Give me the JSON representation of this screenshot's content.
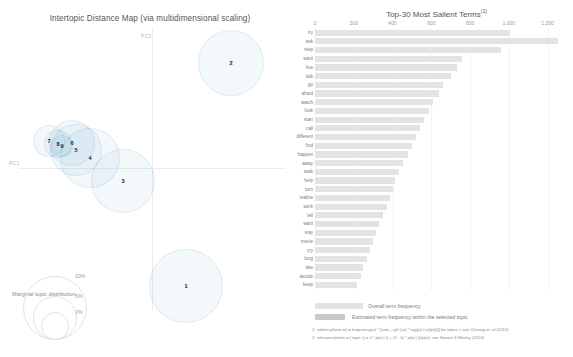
{
  "app": {
    "name": "LDAvis topic model visualization"
  },
  "left_panel": {
    "title": "Intertopic Distance Map (via multidimensional scaling)",
    "axis_labels": {
      "x": "PC1",
      "y": "PC2"
    },
    "marginal_legend": {
      "title": "Marginal topic distribution",
      "sizes": [
        "2%",
        "5%",
        "10%"
      ]
    },
    "topics": [
      {
        "id": "1",
        "cx": 186,
        "cy": 286,
        "r": 37
      },
      {
        "id": "2",
        "cx": 231,
        "cy": 63,
        "r": 33
      },
      {
        "id": "3",
        "cx": 123,
        "cy": 181,
        "r": 32
      },
      {
        "id": "4",
        "cx": 90,
        "cy": 158,
        "r": 30
      },
      {
        "id": "5",
        "cx": 76,
        "cy": 150,
        "r": 26
      },
      {
        "id": "6",
        "cx": 72,
        "cy": 143,
        "r": 23
      },
      {
        "id": "7",
        "cx": 49,
        "cy": 141,
        "r": 16
      },
      {
        "id": "8",
        "cx": 58,
        "cy": 144,
        "r": 14
      },
      {
        "id": "9",
        "cx": 62,
        "cy": 146,
        "r": 11
      }
    ]
  },
  "chart_data": {
    "type": "bar",
    "title": "Top-30 Most Salient Terms",
    "title_superscript": "(1)",
    "orientation": "horizontal",
    "xlabel": "",
    "ylabel": "",
    "xlim": [
      0,
      1300
    ],
    "grid": true,
    "legend_position": "bottom-left",
    "xticks": [
      0,
      200,
      400,
      600,
      800,
      1000,
      1200
    ],
    "xtick_labels": [
      "0",
      "200",
      "400",
      "600",
      "800",
      "1,000",
      "1,200"
    ],
    "legend": [
      {
        "label": "Overall term frequency",
        "color": "#e3e3e3"
      },
      {
        "label": "Estimated term frequency within the selected topic",
        "color": "#c9c9c9"
      }
    ],
    "series": [
      {
        "name": "Overall term frequency",
        "color": "#e3e3e3"
      }
    ],
    "categories": [
      "try",
      "ask",
      "step",
      "want",
      "live",
      "talk",
      "go",
      "afraid",
      "watch",
      "look",
      "start",
      "call",
      "different",
      "find",
      "happen",
      "away",
      "walk",
      "help",
      "turn",
      "realize",
      "work",
      "tell",
      "want",
      "stay",
      "movie",
      "cry",
      "long",
      "late",
      "decide",
      "keep"
    ],
    "values": [
      1005,
      1255,
      960,
      760,
      730,
      700,
      660,
      640,
      610,
      590,
      560,
      540,
      520,
      500,
      480,
      455,
      435,
      415,
      400,
      385,
      370,
      350,
      330,
      315,
      300,
      285,
      270,
      250,
      235,
      215
    ],
    "footnotes": [
      "1. saliency(term w) = frequency(w) * [sum_t p(t | w) * log(p(t | w)/p(t))] for topics t; see Chuang et. al (2012)",
      "2. relevance(term w | topic t) = λ * p(w | t) + (1 - λ) * p(w | t)/p(w); see Sievert & Shirley (2014)"
    ]
  }
}
